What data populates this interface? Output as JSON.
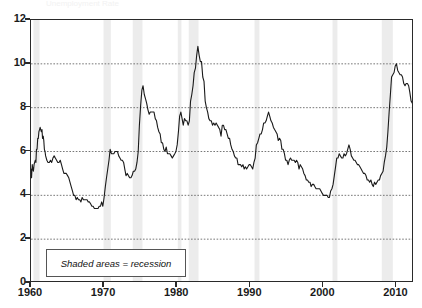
{
  "chart_data": {
    "type": "line",
    "title": "Unemployment Rate",
    "xlabel": "",
    "ylabel": "",
    "xlim": [
      1960,
      2012.4
    ],
    "ylim": [
      0,
      12
    ],
    "grid": true,
    "grid_axis": "y",
    "legend_position": "inside-bottom-left",
    "legend_note": "Shaded areas = recession",
    "series_color": "#1a1a1a",
    "recession_band_color": "#ececec",
    "gridline_color": "#555555",
    "axis_color": "#2a2a2a",
    "ytick_labels": [
      "0",
      "2",
      "4",
      "6",
      "8",
      "10",
      "12"
    ],
    "ytick_values": [
      0,
      2,
      4,
      6,
      8,
      10,
      12
    ],
    "xtick_labels": [
      "1960",
      "1970",
      "1980",
      "1990",
      "2000",
      "2010"
    ],
    "xtick_values": [
      1960,
      1970,
      1980,
      1990,
      2000,
      2010
    ],
    "recessions": [
      {
        "start": 1960.33,
        "end": 1961.17
      },
      {
        "start": 1969.92,
        "end": 1970.92
      },
      {
        "start": 1973.92,
        "end": 1975.25
      },
      {
        "start": 1980.08,
        "end": 1980.58
      },
      {
        "start": 1981.58,
        "end": 1982.92
      },
      {
        "start": 1990.58,
        "end": 1991.25
      },
      {
        "start": 2001.25,
        "end": 2001.92
      },
      {
        "start": 2007.99,
        "end": 2009.5
      }
    ],
    "annotations": [
      {
        "label": "1961 peak",
        "x": 1961.4,
        "y": 7.1
      },
      {
        "label": "1969 trough",
        "x": 1968.9,
        "y": 3.4
      },
      {
        "label": "1975 peak",
        "x": 1975.4,
        "y": 9.0
      },
      {
        "label": "1982 peak",
        "x": 1982.9,
        "y": 10.8
      },
      {
        "label": "1992 peak",
        "x": 1992.5,
        "y": 7.8
      },
      {
        "label": "2000 trough",
        "x": 2000.3,
        "y": 3.9
      },
      {
        "label": "2003 peak",
        "x": 2003.5,
        "y": 6.3
      },
      {
        "label": "2009 peak",
        "x": 2009.8,
        "y": 10.0
      }
    ],
    "x": [
      1960.0,
      1960.08,
      1960.17,
      1960.25,
      1960.33,
      1960.42,
      1960.5,
      1960.58,
      1960.67,
      1960.75,
      1960.83,
      1960.92,
      1961.0,
      1961.08,
      1961.17,
      1961.25,
      1961.33,
      1961.42,
      1961.5,
      1961.58,
      1961.67,
      1961.75,
      1961.83,
      1961.92,
      1962.0,
      1962.17,
      1962.33,
      1962.5,
      1962.67,
      1962.83,
      1963.0,
      1963.17,
      1963.33,
      1963.5,
      1963.67,
      1963.83,
      1964.0,
      1964.17,
      1964.33,
      1964.5,
      1964.67,
      1964.83,
      1965.0,
      1965.17,
      1965.33,
      1965.5,
      1965.67,
      1965.83,
      1966.0,
      1966.17,
      1966.33,
      1966.5,
      1966.67,
      1966.83,
      1967.0,
      1967.17,
      1967.33,
      1967.5,
      1967.67,
      1967.83,
      1968.0,
      1968.17,
      1968.33,
      1968.5,
      1968.67,
      1968.83,
      1969.0,
      1969.17,
      1969.33,
      1969.5,
      1969.67,
      1969.83,
      1970.0,
      1970.17,
      1970.33,
      1970.5,
      1970.67,
      1970.83,
      1971.0,
      1971.17,
      1971.33,
      1971.5,
      1971.67,
      1971.83,
      1972.0,
      1972.17,
      1972.33,
      1972.5,
      1972.67,
      1972.83,
      1973.0,
      1973.17,
      1973.33,
      1973.5,
      1973.67,
      1973.83,
      1974.0,
      1974.17,
      1974.33,
      1974.5,
      1974.67,
      1974.83,
      1975.0,
      1975.17,
      1975.33,
      1975.5,
      1975.67,
      1975.83,
      1976.0,
      1976.17,
      1976.33,
      1976.5,
      1976.67,
      1976.83,
      1977.0,
      1977.17,
      1977.33,
      1977.5,
      1977.67,
      1977.83,
      1978.0,
      1978.17,
      1978.33,
      1978.5,
      1978.67,
      1978.83,
      1979.0,
      1979.17,
      1979.33,
      1979.5,
      1979.67,
      1979.83,
      1980.0,
      1980.17,
      1980.33,
      1980.5,
      1980.67,
      1980.83,
      1981.0,
      1981.17,
      1981.33,
      1981.5,
      1981.67,
      1981.83,
      1982.0,
      1982.17,
      1982.33,
      1982.5,
      1982.67,
      1982.83,
      1983.0,
      1983.17,
      1983.33,
      1983.5,
      1983.67,
      1983.83,
      1984.0,
      1984.17,
      1984.33,
      1984.5,
      1984.67,
      1984.83,
      1985.0,
      1985.17,
      1985.33,
      1985.5,
      1985.67,
      1985.83,
      1986.0,
      1986.17,
      1986.33,
      1986.5,
      1986.67,
      1986.83,
      1987.0,
      1987.17,
      1987.33,
      1987.5,
      1987.67,
      1987.83,
      1988.0,
      1988.17,
      1988.33,
      1988.5,
      1988.67,
      1988.83,
      1989.0,
      1989.17,
      1989.33,
      1989.5,
      1989.67,
      1989.83,
      1990.0,
      1990.17,
      1990.33,
      1990.5,
      1990.67,
      1990.83,
      1991.0,
      1991.17,
      1991.33,
      1991.5,
      1991.67,
      1991.83,
      1992.0,
      1992.17,
      1992.33,
      1992.5,
      1992.67,
      1992.83,
      1993.0,
      1993.17,
      1993.33,
      1993.5,
      1993.67,
      1993.83,
      1994.0,
      1994.17,
      1994.33,
      1994.5,
      1994.67,
      1994.83,
      1995.0,
      1995.17,
      1995.33,
      1995.5,
      1995.67,
      1995.83,
      1996.0,
      1996.17,
      1996.33,
      1996.5,
      1996.67,
      1996.83,
      1997.0,
      1997.17,
      1997.33,
      1997.5,
      1997.67,
      1997.83,
      1998.0,
      1998.17,
      1998.33,
      1998.5,
      1998.67,
      1998.83,
      1999.0,
      1999.17,
      1999.33,
      1999.5,
      1999.67,
      1999.83,
      2000.0,
      2000.17,
      2000.33,
      2000.5,
      2000.67,
      2000.83,
      2001.0,
      2001.17,
      2001.33,
      2001.5,
      2001.67,
      2001.83,
      2002.0,
      2002.17,
      2002.33,
      2002.5,
      2002.67,
      2002.83,
      2003.0,
      2003.17,
      2003.33,
      2003.5,
      2003.67,
      2003.83,
      2004.0,
      2004.17,
      2004.33,
      2004.5,
      2004.67,
      2004.83,
      2005.0,
      2005.17,
      2005.33,
      2005.5,
      2005.67,
      2005.83,
      2006.0,
      2006.17,
      2006.33,
      2006.5,
      2006.67,
      2006.83,
      2007.0,
      2007.17,
      2007.33,
      2007.5,
      2007.67,
      2007.83,
      2008.0,
      2008.17,
      2008.33,
      2008.5,
      2008.67,
      2008.83,
      2009.0,
      2009.17,
      2009.33,
      2009.5,
      2009.67,
      2009.83,
      2010.0,
      2010.17,
      2010.33,
      2010.5,
      2010.67,
      2010.83,
      2011.0,
      2011.17,
      2011.33,
      2011.5,
      2011.67,
      2011.83,
      2012.0,
      2012.17,
      2012.33
    ],
    "y": [
      5.2,
      4.8,
      5.4,
      5.2,
      5.1,
      5.4,
      5.5,
      5.6,
      5.5,
      6.1,
      6.1,
      6.6,
      6.6,
      6.9,
      7.0,
      7.1,
      7.0,
      6.9,
      7.0,
      6.6,
      6.7,
      6.5,
      6.1,
      6.0,
      5.8,
      5.6,
      5.5,
      5.5,
      5.6,
      5.5,
      5.7,
      5.8,
      5.7,
      5.6,
      5.5,
      5.5,
      5.6,
      5.4,
      5.2,
      5.0,
      5.0,
      5.0,
      4.9,
      4.8,
      4.6,
      4.4,
      4.2,
      4.0,
      4.0,
      3.8,
      3.9,
      3.8,
      3.8,
      3.7,
      3.9,
      3.8,
      3.8,
      3.8,
      3.8,
      3.7,
      3.7,
      3.6,
      3.5,
      3.5,
      3.4,
      3.4,
      3.4,
      3.4,
      3.5,
      3.5,
      3.7,
      3.5,
      3.9,
      4.4,
      4.8,
      5.2,
      5.6,
      6.1,
      5.9,
      5.9,
      5.9,
      6.0,
      6.0,
      6.0,
      5.8,
      5.7,
      5.6,
      5.6,
      5.5,
      5.2,
      4.9,
      5.0,
      4.9,
      4.8,
      4.8,
      4.9,
      5.1,
      5.1,
      5.2,
      5.5,
      6.0,
      7.2,
      8.1,
      8.8,
      9.0,
      8.6,
      8.4,
      8.2,
      7.9,
      7.7,
      7.8,
      7.8,
      7.8,
      7.8,
      7.5,
      7.4,
      7.1,
      6.9,
      6.8,
      6.4,
      6.4,
      6.1,
      6.0,
      6.2,
      5.9,
      5.9,
      5.9,
      5.8,
      5.7,
      5.8,
      5.9,
      6.0,
      6.3,
      6.9,
      7.6,
      7.8,
      7.5,
      7.2,
      7.5,
      7.4,
      7.4,
      7.2,
      7.4,
      8.3,
      8.6,
      9.0,
      9.6,
      9.8,
      10.4,
      10.8,
      10.4,
      10.1,
      10.1,
      9.4,
      9.2,
      8.3,
      8.0,
      7.8,
      7.5,
      7.4,
      7.4,
      7.2,
      7.3,
      7.2,
      7.3,
      7.2,
      7.1,
      7.0,
      6.7,
      7.2,
      7.2,
      7.0,
      7.0,
      6.8,
      6.6,
      6.6,
      6.3,
      6.1,
      6.0,
      5.8,
      5.7,
      5.7,
      5.4,
      5.4,
      5.4,
      5.3,
      5.4,
      5.2,
      5.3,
      5.2,
      5.3,
      5.4,
      5.4,
      5.3,
      5.2,
      5.5,
      5.7,
      6.3,
      6.4,
      6.6,
      6.8,
      6.8,
      7.0,
      7.3,
      7.3,
      7.4,
      7.6,
      7.8,
      7.6,
      7.4,
      7.3,
      7.1,
      7.0,
      6.9,
      6.8,
      6.5,
      6.6,
      6.5,
      6.1,
      6.1,
      5.9,
      5.6,
      5.6,
      5.4,
      5.6,
      5.7,
      5.6,
      5.6,
      5.6,
      5.5,
      5.6,
      5.5,
      5.2,
      5.4,
      5.3,
      5.2,
      5.0,
      4.9,
      4.7,
      4.7,
      4.6,
      4.6,
      4.4,
      4.5,
      4.5,
      4.4,
      4.3,
      4.3,
      4.3,
      4.3,
      4.2,
      4.1,
      4.0,
      4.0,
      4.0,
      4.0,
      3.9,
      3.9,
      4.2,
      4.3,
      4.5,
      4.9,
      5.3,
      5.7,
      5.7,
      5.9,
      5.8,
      5.7,
      5.7,
      5.9,
      5.8,
      5.9,
      6.1,
      6.3,
      6.1,
      5.8,
      5.7,
      5.6,
      5.6,
      5.5,
      5.4,
      5.4,
      5.3,
      5.2,
      5.1,
      5.0,
      5.0,
      4.9,
      4.7,
      4.7,
      4.6,
      4.7,
      4.5,
      4.4,
      4.6,
      4.5,
      4.6,
      4.7,
      4.7,
      4.9,
      5.0,
      5.1,
      5.5,
      5.8,
      6.2,
      6.9,
      7.8,
      8.6,
      9.4,
      9.5,
      9.6,
      9.9,
      10.0,
      9.7,
      9.6,
      9.5,
      9.5,
      9.4,
      9.1,
      9.0,
      9.1,
      9.1,
      9.0,
      8.7,
      8.3,
      8.2,
      9.0
    ]
  }
}
